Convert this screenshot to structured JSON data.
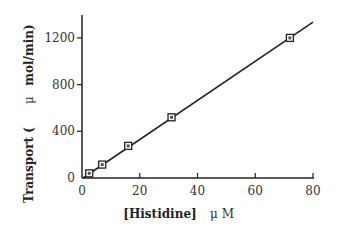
{
  "chart_data": {
    "type": "line",
    "title": "",
    "xlabel": "[Histidine]",
    "xlabel_unit": "μ M",
    "ylabel": "Transport (",
    "ylabel_unit_prefix": "μ",
    "ylabel_unit": "mol/min)",
    "xlim": [
      0,
      80
    ],
    "ylim": [
      0,
      1400
    ],
    "x_ticks": [
      0,
      20,
      40,
      60,
      80
    ],
    "y_ticks": [
      0,
      400,
      800,
      1200
    ],
    "x_tick_labels": [
      "0",
      "20",
      "40",
      "60",
      "80"
    ],
    "y_tick_labels": [
      "0",
      "400",
      "800",
      "1200"
    ],
    "grid": false,
    "legend": null,
    "series": [
      {
        "name": "Transport",
        "marker": "square",
        "x": [
          2.5,
          7,
          16,
          31,
          72
        ],
        "y": [
          40,
          115,
          275,
          520,
          1200
        ]
      }
    ],
    "fit_line": {
      "x": [
        0,
        80
      ],
      "y": [
        0,
        1340
      ]
    }
  }
}
